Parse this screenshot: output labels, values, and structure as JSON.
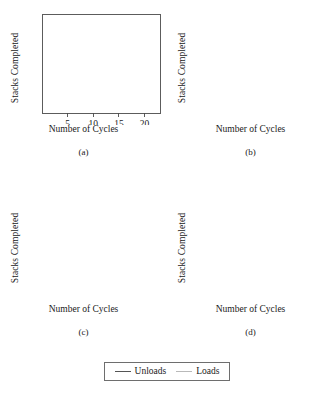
{
  "figure": {
    "panels": [
      "a",
      "b",
      "c",
      "d"
    ],
    "axis": {
      "xlabel": "Number of Cycles",
      "ylabel": "Stacks Completed",
      "xticks": [
        5,
        10,
        15,
        20
      ],
      "xtick_labels": [
        "5",
        "10",
        "15",
        "20"
      ],
      "yticks": [
        "A",
        "B",
        "C",
        "D"
      ],
      "xlim": [
        0,
        23
      ],
      "ylim": [
        0,
        5
      ]
    },
    "legend": {
      "items": [
        {
          "label": "Unloads",
          "color": "#555555"
        },
        {
          "label": "Loads",
          "color": "#b9b9b9"
        }
      ]
    },
    "panel_labels": {
      "a": "(a)",
      "b": "(b)",
      "c": "(c)",
      "d": "(d)"
    }
  },
  "chart_data": {
    "type": "line",
    "title": "",
    "xlabel": "Number of Cycles",
    "ylabel": "Stacks Completed",
    "xlim": [
      0,
      23
    ],
    "ylim": [
      0,
      5
    ],
    "xticks": [
      5,
      10,
      15,
      20
    ],
    "ytick_labels": [
      "A",
      "B",
      "C",
      "D"
    ],
    "grid": false,
    "legend_position": "bottom",
    "legend": [
      "Unloads",
      "Loads"
    ],
    "panels": [
      {
        "name": "(a)",
        "annotations": [
          {
            "text": "Y",
            "type": "double-arrow",
            "x_from": 0.4,
            "x_to": 10.4,
            "y": 3.5
          },
          {
            "text": "Λ",
            "type": "double-arrow",
            "x_from": 11.8,
            "x_to": 22.6,
            "y": 0.5
          }
        ],
        "series": [
          {
            "name": "Unloads",
            "color": "#555555",
            "steps": [
              {
                "y": 1,
                "x_start": 0.0,
                "x_end": 23.0
              },
              {
                "y": 2,
                "x_start": 0.0,
                "x_end": 23.0
              },
              {
                "y": 3,
                "x_start": 0.0,
                "x_end": 23.0
              },
              {
                "y": 4,
                "x_start": 0.0,
                "x_end": 23.0
              }
            ]
          },
          {
            "name": "Loads",
            "color": "#b9b9b9",
            "steps": [
              {
                "y": 0,
                "x_start": 0.0,
                "x_end": 2.8
              },
              {
                "y": 1,
                "x_start": 2.8,
                "x_end": 5.8
              },
              {
                "y": 2,
                "x_start": 5.8,
                "x_end": 7.9
              },
              {
                "y": 3,
                "x_start": 7.9,
                "x_end": 10.4
              },
              {
                "y": 4,
                "x_start": 10.4,
                "x_end": 20.0
              },
              {
                "y": 1,
                "x_start": 11.8,
                "x_end": 23.0
              },
              {
                "y": 2,
                "x_start": 16.8,
                "x_end": 23.0
              },
              {
                "y": 3,
                "x_start": 20.0,
                "x_end": 23.0
              }
            ]
          }
        ]
      },
      {
        "name": "(b)",
        "annotations": [],
        "series": [
          {
            "name": "Unloads",
            "color": "#555555",
            "steps": [
              {
                "y": 1,
                "x_start": 0.0,
                "x_end": 23.0
              },
              {
                "y": 2,
                "x_start": 0.0,
                "x_end": 23.0
              },
              {
                "y": 3,
                "x_start": 0.0,
                "x_end": 23.0
              },
              {
                "y": 4,
                "x_start": 0.0,
                "x_end": 23.0
              }
            ]
          },
          {
            "name": "Loads",
            "color": "#b9b9b9",
            "steps": [
              {
                "y": 0,
                "x_start": 0.0,
                "x_end": 3.3
              },
              {
                "y": 1,
                "x_start": 3.3,
                "x_end": 6.2
              },
              {
                "y": 2,
                "x_start": 6.2,
                "x_end": 8.1
              },
              {
                "y": 3,
                "x_start": 8.1,
                "x_end": 10.5
              },
              {
                "y": 4,
                "x_start": 10.5,
                "x_end": 14.2
              },
              {
                "y": 1,
                "x_start": 11.3,
                "x_end": 23.0
              },
              {
                "y": 2,
                "x_start": 10.5,
                "x_end": 23.0
              },
              {
                "y": 3,
                "x_start": 14.2,
                "x_end": 23.0
              }
            ]
          }
        ]
      },
      {
        "name": "(c)",
        "annotations": [],
        "series": [
          {
            "name": "Unloads",
            "color": "#555555",
            "steps": [
              {
                "y": 1,
                "x_start": 0.0,
                "x_end": 23.0
              },
              {
                "y": 2,
                "x_start": 0.0,
                "x_end": 23.0
              },
              {
                "y": 3,
                "x_start": 0.0,
                "x_end": 23.0
              },
              {
                "y": 4,
                "x_start": 0.0,
                "x_end": 23.0
              }
            ]
          },
          {
            "name": "Loads",
            "color": "#b9b9b9",
            "steps": [
              {
                "y": 0,
                "x_start": 0.0,
                "x_end": 2.9
              },
              {
                "y": 1,
                "x_start": 2.9,
                "x_end": 5.5
              },
              {
                "y": 2,
                "x_start": 5.5,
                "x_end": 7.7
              },
              {
                "y": 3,
                "x_start": 7.7,
                "x_end": 10.2
              },
              {
                "y": 4,
                "x_start": 10.2,
                "x_end": 13.2
              },
              {
                "y": 1,
                "x_start": 10.2,
                "x_end": 23.0
              },
              {
                "y": 3,
                "x_start": 13.2,
                "x_end": 23.0
              }
            ]
          }
        ]
      },
      {
        "name": "(d)",
        "annotations": [
          {
            "text": "U_B",
            "display": "U",
            "subscript": "B",
            "type": "double-arrow",
            "x_from": 0.4,
            "x_to": 3.1,
            "y": 0.62
          },
          {
            "text": "Λ",
            "type": "double-arrow",
            "x_from": 0.4,
            "x_to": 13.6,
            "y": 0.32
          }
        ],
        "series": [
          {
            "name": "Unloads",
            "color": "#555555",
            "steps": [
              {
                "y": 1,
                "x_start": 0.0,
                "x_end": 23.0
              },
              {
                "y": 2,
                "x_start": 0.0,
                "x_end": 23.0
              },
              {
                "y": 3,
                "x_start": 0.0,
                "x_end": 23.0
              },
              {
                "y": 4,
                "x_start": 0.0,
                "x_end": 23.0
              }
            ]
          },
          {
            "name": "Loads",
            "color": "#b9b9b9",
            "steps": [
              {
                "y": 0,
                "x_start": 0.0,
                "x_end": 3.1
              },
              {
                "y": 1,
                "x_start": 3.1,
                "x_end": 6.0
              },
              {
                "y": 2,
                "x_start": 6.0,
                "x_end": 8.3
              },
              {
                "y": 3,
                "x_start": 8.3,
                "x_end": 10.4
              },
              {
                "y": 4,
                "x_start": 10.4,
                "x_end": 13.6
              },
              {
                "y": 1,
                "x_start": 8.3,
                "x_end": 23.0
              },
              {
                "y": 3,
                "x_start": 13.6,
                "x_end": 23.0
              }
            ]
          }
        ]
      }
    ]
  }
}
